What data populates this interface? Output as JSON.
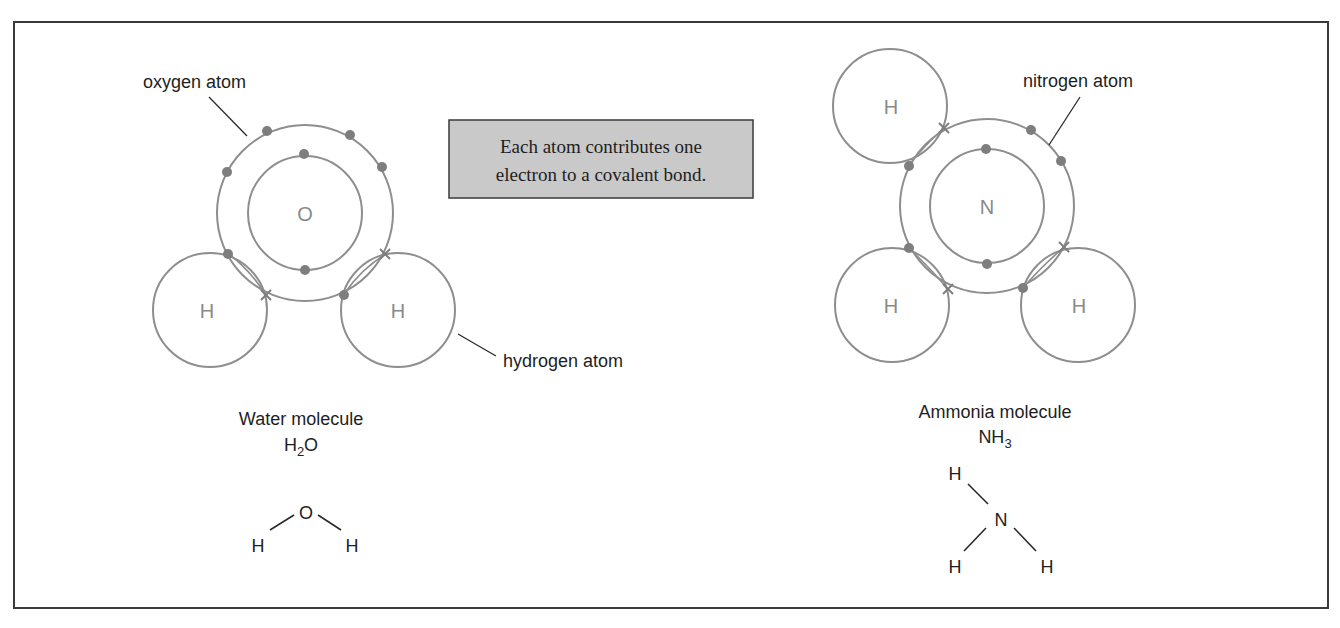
{
  "note": {
    "line1": "Each atom contributes one",
    "line2": "electron to a covalent bond."
  },
  "water": {
    "central_symbol": "O",
    "hydrogen_symbol": "H",
    "label_central_atom": "oxygen atom",
    "label_hydrogen_atom": "hydrogen atom",
    "caption_name": "Water molecule",
    "caption_formula_main": "H",
    "caption_formula_sub": "2",
    "caption_formula_tail": "O",
    "structural": {
      "center": "O",
      "left": "H",
      "right": "H"
    },
    "inner_shell_electrons": 2,
    "outer_shell_electrons": 6,
    "shared_bonds": 2
  },
  "ammonia": {
    "central_symbol": "N",
    "hydrogen_symbol": "H",
    "label_central_atom": "nitrogen atom",
    "caption_name": "Ammonia molecule",
    "caption_formula_main": "NH",
    "caption_formula_sub": "3",
    "structural": {
      "center": "N",
      "top": "H",
      "bottom_left": "H",
      "bottom_right": "H"
    },
    "inner_shell_electrons": 2,
    "outer_shell_electrons": 5,
    "shared_bonds": 3
  },
  "colors": {
    "shell_stroke": "#8e8e8e",
    "electron_fill": "#7e7e7e",
    "note_box_fill": "#c9c9c9",
    "frame_stroke": "#3a3a3a",
    "text": "#1e1e1e"
  }
}
